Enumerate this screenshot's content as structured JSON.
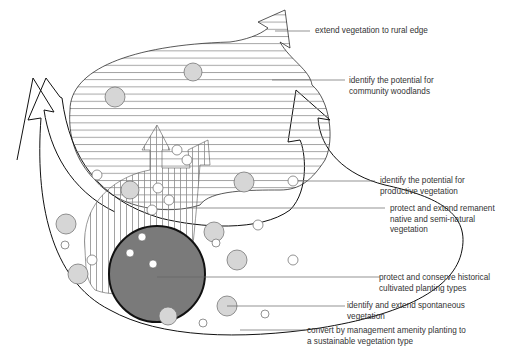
{
  "diagram": {
    "type": "vegetation strategy diagram",
    "colors": {
      "outline": "#111111",
      "hatch": "#888888",
      "circle_fill": "#d6d6d6",
      "core_fill": "#7a7a7a",
      "leader": "#666666"
    },
    "labels": [
      {
        "id": "rural-edge",
        "lines": [
          "extend vegetation to rural edge"
        ]
      },
      {
        "id": "community-woodlands",
        "lines": [
          "identify the potential for",
          "community woodlands"
        ]
      },
      {
        "id": "productive-vegetation",
        "lines": [
          "identify the potential for",
          "productive vegetation"
        ]
      },
      {
        "id": "remanent-native",
        "lines": [
          "protect and extend remanent",
          "native and semi-natural",
          "vegetation"
        ]
      },
      {
        "id": "historical-planting",
        "lines": [
          "protect and conserve historical",
          "cultivated planting types"
        ]
      },
      {
        "id": "spontaneous-vegetation",
        "lines": [
          "identify and extend spontaneous",
          "vegetation"
        ]
      },
      {
        "id": "amenity-planting",
        "lines": [
          "convert by management amenity planting to",
          "a sustainable vegetation type"
        ]
      }
    ]
  }
}
